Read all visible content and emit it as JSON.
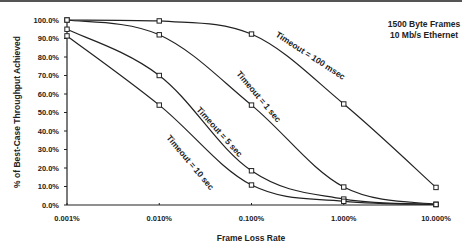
{
  "chart_data": {
    "type": "line",
    "title": "",
    "xlabel": "Frame Loss Rate",
    "ylabel": "% of Best-Case Throughput Achieved",
    "x_scale": "log",
    "x": [
      0.001,
      0.01,
      0.1,
      1.0,
      10.0
    ],
    "x_tick_labels": [
      "0.001%",
      "0.010%",
      "0.100%",
      "1.000%",
      "10.000%"
    ],
    "y_tick_labels": [
      "0.0%",
      "10.0%",
      "20.0%",
      "30.0%",
      "40.0%",
      "50.0%",
      "60.0%",
      "70.0%",
      "80.0%",
      "90.0%",
      "100.0%"
    ],
    "ylim": [
      0,
      100
    ],
    "grid": false,
    "annotations": [
      "1500 Byte Frames",
      "10 Mb/s Ethernet"
    ],
    "series": [
      {
        "name": "Timeout = 100 msec",
        "values": [
          100.0,
          99.5,
          92.4,
          54.6,
          9.5
        ]
      },
      {
        "name": "Timeout = 1 sec",
        "values": [
          100.0,
          92.0,
          54.0,
          9.7,
          0.3
        ]
      },
      {
        "name": "Timeout = 5 sec",
        "values": [
          95.0,
          70.0,
          18.5,
          3.2,
          0.3
        ]
      },
      {
        "name": "Timeout = 10 sec",
        "values": [
          91.4,
          54.0,
          10.8,
          2.0,
          0.3
        ]
      }
    ]
  },
  "labels": {
    "note_line1": "1500 Byte Frames",
    "note_line2": "10 Mb/s Ethernet",
    "xlabel": "Frame Loss Rate",
    "ylabel": "% of Best-Case Throughput Achieved",
    "curve_100ms": "Timeout = 100 msec",
    "curve_1s": "Timeout = 1 sec",
    "curve_5s": "Timeout = 5 sec",
    "curve_10s": "Timeout = 10 sec",
    "x_ticks": [
      "0.001%",
      "0.010%",
      "0.100%",
      "1.000%",
      "10.000%"
    ],
    "y_ticks": [
      "0.0%",
      "10.0%",
      "20.0%",
      "30.0%",
      "40.0%",
      "50.0%",
      "60.0%",
      "70.0%",
      "80.0%",
      "90.0%",
      "100.0%"
    ]
  },
  "colors": {
    "line": "#222222",
    "axis": "#222222",
    "background": "#ffffff"
  }
}
